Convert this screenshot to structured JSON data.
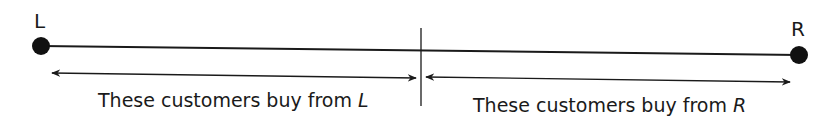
{
  "diagram": {
    "endpoints": {
      "left": {
        "label": "L"
      },
      "right": {
        "label": "R"
      }
    },
    "segments": {
      "left": {
        "text": "These customers buy from ",
        "firm": "L"
      },
      "right": {
        "text": "These customers buy from ",
        "firm": "R"
      }
    },
    "colors": {
      "ink": "#1a1a1a",
      "background": "#ffffff"
    }
  }
}
